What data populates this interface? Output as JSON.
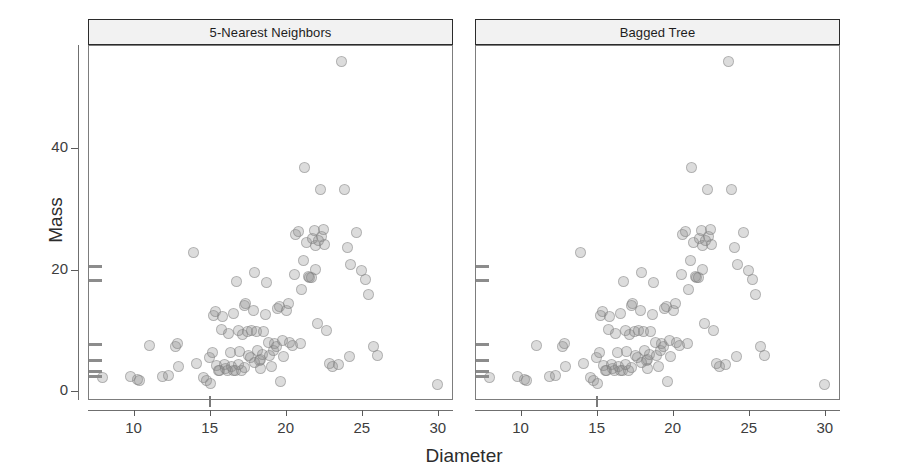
{
  "chart_data": {
    "type": "scatter",
    "title": "",
    "xlabel": "Diameter",
    "ylabel": "Mass",
    "xlim": [
      7.0,
      31.0
    ],
    "ylim": [
      -1.5,
      57.0
    ],
    "xticks": [
      10,
      15,
      20,
      25,
      30
    ],
    "yticks": [
      0,
      20,
      40
    ],
    "grid": false,
    "legend_position": "none",
    "panels": [
      {
        "label": "5-Nearest Neighbors",
        "points": [
          [
            7.9,
            2.4
          ],
          [
            9.7,
            2.6
          ],
          [
            10.2,
            2.0
          ],
          [
            10.3,
            1.8
          ],
          [
            11.0,
            7.6
          ],
          [
            11.8,
            2.5
          ],
          [
            12.2,
            2.7
          ],
          [
            12.7,
            7.4
          ],
          [
            12.8,
            7.9
          ],
          [
            12.9,
            4.2
          ],
          [
            13.9,
            22.9
          ],
          [
            14.1,
            4.6
          ],
          [
            14.5,
            2.3
          ],
          [
            14.7,
            1.9
          ],
          [
            14.9,
            5.6
          ],
          [
            15.0,
            1.4
          ],
          [
            15.1,
            6.5
          ],
          [
            15.2,
            12.6
          ],
          [
            15.3,
            13.2
          ],
          [
            15.4,
            4.4
          ],
          [
            15.5,
            3.6
          ],
          [
            15.6,
            3.5
          ],
          [
            15.7,
            10.3
          ],
          [
            15.8,
            12.4
          ],
          [
            15.9,
            4.5
          ],
          [
            16.0,
            3.9
          ],
          [
            16.1,
            3.5
          ],
          [
            16.2,
            9.7
          ],
          [
            16.3,
            6.5
          ],
          [
            16.4,
            4.2
          ],
          [
            16.5,
            3.5
          ],
          [
            16.6,
            3.6
          ],
          [
            16.7,
            18.2
          ],
          [
            16.8,
            10.1
          ],
          [
            16.9,
            6.6
          ],
          [
            17.0,
            3.6
          ],
          [
            17.1,
            9.4
          ],
          [
            17.2,
            14.2
          ],
          [
            17.3,
            14.6
          ],
          [
            17.4,
            9.9
          ],
          [
            17.5,
            6.0
          ],
          [
            17.6,
            5.6
          ],
          [
            17.7,
            10.2
          ],
          [
            17.8,
            13.4
          ],
          [
            17.9,
            19.7
          ],
          [
            18.0,
            9.9
          ],
          [
            18.1,
            6.8
          ],
          [
            18.2,
            5.1
          ],
          [
            18.3,
            5.3
          ],
          [
            18.4,
            6.1
          ],
          [
            18.5,
            10.0
          ],
          [
            18.6,
            12.8
          ],
          [
            18.7,
            18.1
          ],
          [
            18.8,
            8.2
          ],
          [
            18.9,
            6.0
          ],
          [
            19.0,
            4.2
          ],
          [
            19.1,
            6.9
          ],
          [
            19.2,
            8.0
          ],
          [
            19.3,
            7.5
          ],
          [
            19.4,
            13.7
          ],
          [
            19.5,
            14.1
          ],
          [
            19.6,
            1.7
          ],
          [
            19.8,
            5.9
          ],
          [
            20.0,
            13.4
          ],
          [
            20.2,
            8.2
          ],
          [
            20.4,
            7.6
          ],
          [
            20.6,
            25.9
          ],
          [
            20.8,
            26.4
          ],
          [
            20.9,
            8.0
          ],
          [
            21.0,
            16.8
          ],
          [
            21.1,
            21.6
          ],
          [
            21.2,
            37.0
          ],
          [
            21.3,
            24.6
          ],
          [
            21.4,
            19.0
          ],
          [
            21.5,
            18.9
          ],
          [
            21.6,
            18.8
          ],
          [
            21.7,
            25.3
          ],
          [
            21.8,
            26.6
          ],
          [
            21.9,
            24.2
          ],
          [
            22.0,
            11.3
          ],
          [
            22.2,
            33.3
          ],
          [
            22.3,
            25.6
          ],
          [
            22.4,
            26.8
          ],
          [
            22.5,
            24.3
          ],
          [
            22.6,
            10.2
          ],
          [
            22.8,
            4.6
          ],
          [
            23.0,
            4.2
          ],
          [
            23.4,
            4.5
          ],
          [
            23.6,
            54.4
          ],
          [
            23.8,
            33.3
          ],
          [
            24.0,
            23.8
          ],
          [
            24.1,
            5.8
          ],
          [
            24.2,
            21.0
          ],
          [
            24.6,
            26.3
          ],
          [
            24.9,
            20.0
          ],
          [
            25.2,
            18.6
          ],
          [
            25.4,
            16.0
          ],
          [
            25.7,
            7.5
          ],
          [
            26.0,
            6.0
          ],
          [
            29.9,
            1.3
          ],
          [
            17.2,
            4.0
          ],
          [
            16.8,
            4.5
          ],
          [
            18.3,
            3.9
          ],
          [
            20.1,
            14.5
          ],
          [
            21.9,
            20.2
          ],
          [
            19.7,
            8.4
          ],
          [
            17.9,
            4.8
          ],
          [
            16.5,
            13.0
          ],
          [
            20.5,
            19.4
          ],
          [
            22.1,
            25.0
          ]
        ]
      },
      {
        "label": "Bagged Tree",
        "points": [
          [
            7.9,
            2.4
          ],
          [
            9.7,
            2.6
          ],
          [
            10.2,
            2.0
          ],
          [
            10.3,
            1.8
          ],
          [
            11.0,
            7.6
          ],
          [
            11.8,
            2.5
          ],
          [
            12.2,
            2.7
          ],
          [
            12.7,
            7.4
          ],
          [
            12.8,
            7.9
          ],
          [
            12.9,
            4.2
          ],
          [
            13.9,
            22.9
          ],
          [
            14.1,
            4.6
          ],
          [
            14.5,
            2.3
          ],
          [
            14.7,
            1.9
          ],
          [
            14.9,
            5.6
          ],
          [
            15.0,
            1.4
          ],
          [
            15.1,
            6.5
          ],
          [
            15.2,
            12.6
          ],
          [
            15.3,
            13.2
          ],
          [
            15.4,
            4.4
          ],
          [
            15.5,
            3.6
          ],
          [
            15.6,
            3.5
          ],
          [
            15.7,
            10.3
          ],
          [
            15.8,
            12.4
          ],
          [
            15.9,
            4.5
          ],
          [
            16.0,
            3.9
          ],
          [
            16.1,
            3.5
          ],
          [
            16.2,
            9.7
          ],
          [
            16.3,
            6.5
          ],
          [
            16.4,
            4.2
          ],
          [
            16.5,
            3.5
          ],
          [
            16.6,
            3.6
          ],
          [
            16.7,
            18.2
          ],
          [
            16.8,
            10.1
          ],
          [
            16.9,
            6.6
          ],
          [
            17.0,
            3.6
          ],
          [
            17.1,
            9.4
          ],
          [
            17.2,
            14.2
          ],
          [
            17.3,
            14.6
          ],
          [
            17.4,
            9.9
          ],
          [
            17.5,
            6.0
          ],
          [
            17.6,
            5.6
          ],
          [
            17.7,
            10.2
          ],
          [
            17.8,
            13.4
          ],
          [
            17.9,
            19.7
          ],
          [
            18.0,
            9.9
          ],
          [
            18.1,
            6.8
          ],
          [
            18.2,
            5.1
          ],
          [
            18.3,
            5.3
          ],
          [
            18.4,
            6.1
          ],
          [
            18.5,
            10.0
          ],
          [
            18.6,
            12.8
          ],
          [
            18.7,
            18.1
          ],
          [
            18.8,
            8.2
          ],
          [
            18.9,
            6.0
          ],
          [
            19.0,
            4.2
          ],
          [
            19.1,
            6.9
          ],
          [
            19.2,
            8.0
          ],
          [
            19.3,
            7.5
          ],
          [
            19.4,
            13.7
          ],
          [
            19.5,
            14.1
          ],
          [
            19.6,
            1.7
          ],
          [
            19.8,
            5.9
          ],
          [
            20.0,
            13.4
          ],
          [
            20.2,
            8.2
          ],
          [
            20.4,
            7.6
          ],
          [
            20.6,
            25.9
          ],
          [
            20.8,
            26.4
          ],
          [
            20.9,
            8.0
          ],
          [
            21.0,
            16.8
          ],
          [
            21.1,
            21.6
          ],
          [
            21.2,
            37.0
          ],
          [
            21.3,
            24.6
          ],
          [
            21.4,
            19.0
          ],
          [
            21.5,
            18.9
          ],
          [
            21.6,
            18.8
          ],
          [
            21.7,
            25.3
          ],
          [
            21.8,
            26.6
          ],
          [
            21.9,
            24.2
          ],
          [
            22.0,
            11.3
          ],
          [
            22.2,
            33.3
          ],
          [
            22.3,
            25.6
          ],
          [
            22.4,
            26.8
          ],
          [
            22.5,
            24.3
          ],
          [
            22.6,
            10.2
          ],
          [
            22.8,
            4.6
          ],
          [
            23.0,
            4.2
          ],
          [
            23.4,
            4.5
          ],
          [
            23.6,
            54.4
          ],
          [
            23.8,
            33.3
          ],
          [
            24.0,
            23.8
          ],
          [
            24.1,
            5.8
          ],
          [
            24.2,
            21.0
          ],
          [
            24.6,
            26.3
          ],
          [
            24.9,
            20.0
          ],
          [
            25.2,
            18.6
          ],
          [
            25.4,
            16.0
          ],
          [
            25.7,
            7.5
          ],
          [
            26.0,
            6.0
          ],
          [
            29.9,
            1.3
          ],
          [
            17.2,
            4.0
          ],
          [
            16.8,
            4.5
          ],
          [
            18.3,
            3.9
          ],
          [
            20.1,
            14.5
          ],
          [
            21.9,
            20.2
          ],
          [
            19.7,
            8.4
          ],
          [
            17.9,
            4.8
          ],
          [
            16.5,
            13.0
          ],
          [
            20.5,
            19.4
          ],
          [
            22.1,
            25.0
          ]
        ]
      }
    ],
    "y_rug_values": [
      20.6,
      18.3,
      7.8,
      5.1,
      3.2,
      2.5
    ],
    "x_rug_values": [
      15.0
    ]
  },
  "colors": {
    "point_fill": "#8c8c8c",
    "strip_background": "#f2f2f2",
    "strip_border": "#2b2b2b",
    "axis": "#6f6f6f",
    "text": "#2c2c2c"
  }
}
